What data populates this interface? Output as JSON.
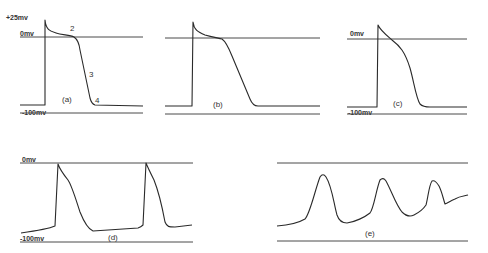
{
  "figure": {
    "panels": [
      {
        "id": "a",
        "label": "(a)",
        "axis_labels": {
          "top": "+25mv",
          "zero": "0mv",
          "bottom": "-100mv"
        },
        "phase_labels": [
          "2",
          "3",
          "4"
        ]
      },
      {
        "id": "b",
        "label": "(b)"
      },
      {
        "id": "c",
        "label": "(c)",
        "axis_labels": {
          "zero": "0mv",
          "bottom": "-100mv"
        }
      },
      {
        "id": "d",
        "label": "(d)",
        "axis_labels": {
          "zero": "0mv",
          "bottom": "-100mv"
        }
      },
      {
        "id": "e",
        "label": "(e)"
      }
    ]
  },
  "colors": {
    "line": "#4a4a4a",
    "trace": "#2a2a2a",
    "background": "#ffffff"
  }
}
